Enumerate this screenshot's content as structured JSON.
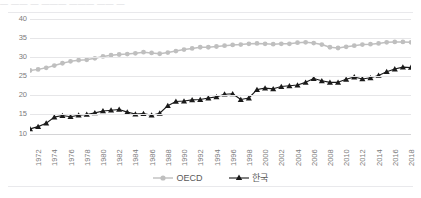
{
  "top_bleed_text": "—    ——   —   ——— ———   ——  —",
  "axes": {
    "y_ticks": [
      "40",
      "35",
      "30",
      "25",
      "20",
      "15",
      "10"
    ],
    "y_min": 10,
    "y_max": 40,
    "x_ticks": [
      "1972",
      "1974",
      "1976",
      "1978",
      "1980",
      "1982",
      "1984",
      "1986",
      "1988",
      "1990",
      "1992",
      "1994",
      "1996",
      "1998",
      "2000",
      "2002",
      "2004",
      "2006",
      "2008",
      "2010",
      "2012",
      "2014",
      "2016",
      "2018"
    ],
    "x_min": 1972,
    "x_max": 2019
  },
  "legend": {
    "position": "bottom-center",
    "items": [
      {
        "label": "OECD",
        "color": "#bfbfbf",
        "marker": "circle"
      },
      {
        "label": "한국",
        "color": "#1a1a1a",
        "marker": "triangle"
      }
    ]
  },
  "colors": {
    "oecd": "#bfbfbf",
    "korea": "#1a1a1a",
    "gridline": "#e6e6e8",
    "axis_text": "#7b7b7b",
    "rule": "#e9e9ec"
  },
  "chart_data": {
    "type": "line",
    "title": "",
    "subtitle": "",
    "xlabel": "",
    "ylabel": "",
    "xlim": [
      1972,
      2019
    ],
    "ylim": [
      10,
      40
    ],
    "grid": true,
    "legend_position": "bottom-center",
    "x": [
      1972,
      1973,
      1974,
      1975,
      1976,
      1977,
      1978,
      1979,
      1980,
      1981,
      1982,
      1983,
      1984,
      1985,
      1986,
      1987,
      1988,
      1989,
      1990,
      1991,
      1992,
      1993,
      1994,
      1995,
      1996,
      1997,
      1998,
      1999,
      2000,
      2001,
      2002,
      2003,
      2004,
      2005,
      2006,
      2007,
      2008,
      2009,
      2010,
      2011,
      2012,
      2013,
      2014,
      2015,
      2016,
      2017,
      2018,
      2019
    ],
    "series": [
      {
        "name": "OECD",
        "marker": "circle",
        "color": "#bfbfbf",
        "values": [
          26.5,
          26.8,
          27.2,
          27.8,
          28.4,
          28.9,
          29.2,
          29.3,
          29.7,
          30.2,
          30.5,
          30.7,
          30.8,
          31.0,
          31.3,
          31.1,
          30.9,
          31.2,
          31.6,
          32.0,
          32.3,
          32.6,
          32.6,
          32.8,
          33.0,
          33.2,
          33.3,
          33.5,
          33.6,
          33.5,
          33.4,
          33.5,
          33.5,
          33.8,
          33.9,
          33.7,
          33.3,
          32.6,
          32.4,
          32.7,
          33.0,
          33.3,
          33.4,
          33.6,
          33.9,
          34.0,
          34.0,
          33.9
        ]
      },
      {
        "name": "한국",
        "marker": "triangle",
        "color": "#1a1a1a",
        "values": [
          11.2,
          11.8,
          12.7,
          14.3,
          14.7,
          14.4,
          14.8,
          15.0,
          15.4,
          15.9,
          16.1,
          16.3,
          15.6,
          15.1,
          15.2,
          14.8,
          15.3,
          17.3,
          18.4,
          18.5,
          18.8,
          18.9,
          19.3,
          19.6,
          20.3,
          20.4,
          18.9,
          19.3,
          21.5,
          21.9,
          21.7,
          22.3,
          22.5,
          22.7,
          23.4,
          24.4,
          23.8,
          23.4,
          23.4,
          24.2,
          24.8,
          24.3,
          24.6,
          25.2,
          26.2,
          26.9,
          27.4,
          27.3
        ]
      }
    ]
  }
}
